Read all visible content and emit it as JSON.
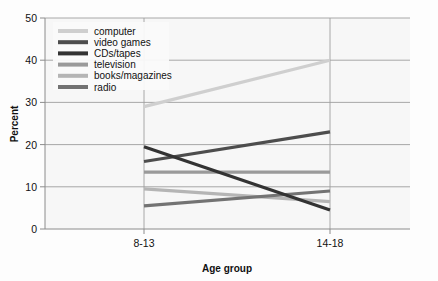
{
  "chart_data": {
    "type": "line",
    "title": "",
    "xlabel": "Age group",
    "ylabel": "Percent",
    "categories": [
      "8-13",
      "14-18"
    ],
    "x": [
      0,
      1
    ],
    "ylim": [
      0,
      50
    ],
    "yticks": [
      0,
      10,
      20,
      30,
      40,
      50
    ],
    "ytick_labels": [
      "0",
      "10",
      "20",
      "30",
      "40",
      "50"
    ],
    "xtick_labels": [
      "8-13",
      "14-18"
    ],
    "grid": "horizontal",
    "legend_position": "top-left-inside",
    "series": [
      {
        "name": "computer",
        "values": [
          29,
          40
        ],
        "color": "#cfcfcf"
      },
      {
        "name": "video games",
        "values": [
          16,
          23
        ],
        "color": "#4d4d4d"
      },
      {
        "name": "CDs/tapes",
        "values": [
          19.5,
          4.5
        ],
        "color": "#333333"
      },
      {
        "name": "television",
        "values": [
          13.5,
          13.5
        ],
        "color": "#9a9a9a"
      },
      {
        "name": "books/magazines",
        "values": [
          9.5,
          6.5
        ],
        "color": "#b5b5b5"
      },
      {
        "name": "radio",
        "values": [
          5.5,
          9
        ],
        "color": "#737373"
      }
    ]
  },
  "axes": {
    "y_axis_title": "Percent",
    "x_axis_title": "Age group",
    "y_ticks": [
      "50",
      "40",
      "30",
      "20",
      "10",
      "0"
    ],
    "x_ticks": [
      "8-13",
      "14-18"
    ]
  },
  "legend": {
    "items": [
      {
        "label": "computer"
      },
      {
        "label": "video games"
      },
      {
        "label": "CDs/tapes"
      },
      {
        "label": "television"
      },
      {
        "label": "books/magazines"
      },
      {
        "label": "radio"
      }
    ]
  },
  "colors": {
    "grid": "#9e9e9e",
    "axis": "#8c8c8c",
    "text": "#111111",
    "plot_background": "#f7f7f7",
    "page_background": "#fdfdfd"
  }
}
